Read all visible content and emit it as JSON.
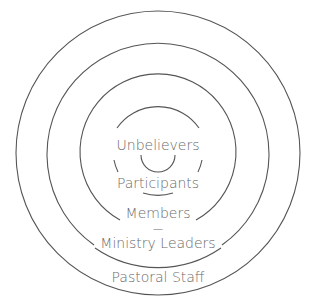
{
  "diagram": {
    "type": "concentric-circles",
    "title": "",
    "colors": {
      "stroke": "#555555",
      "text": "#6b6b6b",
      "background": "#ffffff"
    },
    "levels": [
      {
        "label": "Unbelievers",
        "order": 1
      },
      {
        "label": "Participants",
        "order": 2
      },
      {
        "label": "Members",
        "order": 3
      },
      {
        "label": "Ministry Leaders",
        "order": 4
      },
      {
        "label": "Pastoral Staff",
        "order": 5
      }
    ],
    "separator": "—"
  }
}
